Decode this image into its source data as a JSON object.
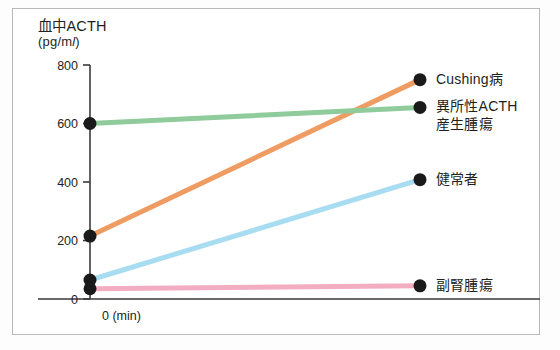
{
  "figure": {
    "title": "血中ACTH",
    "unit": "(pg/ml)",
    "unit_prefix": "(pg/m",
    "unit_italic": "l",
    "unit_suffix": ")"
  },
  "chart_data": {
    "type": "line",
    "title": "血中ACTH",
    "ylabel": "血中ACTH (pg/ml)",
    "xlabel": "0 (min)",
    "ylim": [
      0,
      800
    ],
    "yticks": [
      0,
      200,
      400,
      600,
      800
    ],
    "ytick_labels": [
      "0",
      "200",
      "400",
      "600",
      "800"
    ],
    "xtick_labels": [
      "0 (min)"
    ],
    "grid": false,
    "legend_position": "right",
    "x": [
      0,
      1
    ],
    "series": [
      {
        "name": "Cushing病",
        "label": "Cushing病",
        "color": "#ef9c63",
        "values": [
          215,
          750
        ]
      },
      {
        "name": "異所性ACTH産生腫瘍",
        "label": "異所性ACTH\n産生腫瘍",
        "color": "#8fcb9b",
        "values": [
          600,
          655
        ]
      },
      {
        "name": "健常者",
        "label": "健常者",
        "color": "#a8dcf0",
        "values": [
          65,
          408
        ]
      },
      {
        "name": "副腎腫瘍",
        "label": "副腎腫瘍",
        "color": "#f3adc3",
        "values": [
          35,
          45
        ]
      }
    ]
  },
  "style": {
    "marker_color": "#1a1a1a",
    "axis_color": "#3a3a3a",
    "frame_color": "#b9b9b9",
    "text_color": "#231f20"
  }
}
